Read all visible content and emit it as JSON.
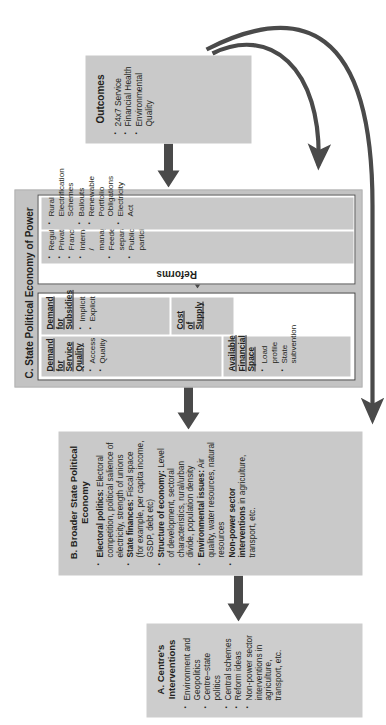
{
  "diagram": {
    "type": "flow-diagram",
    "orientation": "rotated-90-ccw",
    "colors": {
      "panel_fill": "#c9c9c9",
      "card_fill": "#ffffff",
      "card_border": "#3b3b3b",
      "arrow": "#4a4a4a",
      "text": "#231f20"
    }
  },
  "boxA": {
    "title": "A. Centre's Interventions",
    "bullets": [
      "Environment and Geopolitics",
      "Centre–state politics",
      "Central schemes",
      "Reform ideas",
      "Non-power sector interventions in agriculture, transport, etc."
    ]
  },
  "boxB": {
    "title": "B. Broader State Political Economy",
    "bullets": [
      {
        "lead": "Electoral politics:",
        "rest": " Electoral competition, political salience of electricity, strength of unions"
      },
      {
        "lead": "State finances:",
        "rest": " Fiscal space (for example, per capita income, GSDP, debt etc)"
      },
      {
        "lead": "Structure of economy:",
        "rest": " Level of development, sectoral characteristics, rural/urban divide, population density"
      },
      {
        "lead": "Environmental issues:",
        "rest": " Air quality, water resources, natural resources"
      },
      {
        "lead": "Non-power sector interventions",
        "rest": " in agriculture, transport, etc."
      }
    ]
  },
  "boxC": {
    "title": "C. State Political Economy of Power",
    "quadrants": [
      {
        "heading": "Demand for Service Quality",
        "bullets": [
          "Access",
          "Quality"
        ]
      },
      {
        "heading": "Demand for Subsidies",
        "bullets": [
          "Implicit",
          "Explicit"
        ]
      },
      {
        "heading": "Available Financial Space",
        "bullets": [
          "Load profile",
          "State subvention"
        ]
      },
      {
        "heading": "Cost of Supply",
        "bullets": []
      }
    ],
    "reforms": {
      "title": "Reforms",
      "column_left": [
        "Regulators",
        "Privatization",
        "Franchisees",
        "Internal / managerial",
        "Feeder separation",
        "Public participation"
      ],
      "column_right": [
        "Rural Electrification Schemes",
        "Bailouts",
        "Renewable Portfolio Obligations",
        "Electricity Act"
      ]
    }
  },
  "outcomes": {
    "title": "Outcomes",
    "bullets": [
      "24x7 Service",
      "Financial Health",
      "Environmental Quality"
    ]
  },
  "arrows": {
    "a_to_b": "A to B upward block arrow",
    "b_to_c": "B to C upward block arrow",
    "c_to_outcomes": "C to Outcomes upward block arrow",
    "demand_reforms": "double-headed arrow between demand card and reforms",
    "feedback_to_reforms": "curved feedback arrow from Outcomes to Reforms",
    "feedback_to_b": "curved feedback arrow from Outcomes to B"
  }
}
